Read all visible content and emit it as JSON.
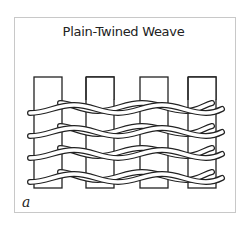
{
  "figure": {
    "title": "Plain-Twined Weave",
    "panel_label": "a",
    "warp_count": 4,
    "weft_row_count": 4,
    "stroke_color": "#222222",
    "fill_color": "#ffffff"
  }
}
